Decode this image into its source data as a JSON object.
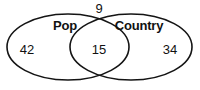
{
  "diagram": {
    "type": "venn-two-set",
    "stroke_color": "#141414",
    "fill_color": "none",
    "background_color": "#ffffff",
    "sets": [
      {
        "id": "left",
        "title": "Pop",
        "title_x": 65,
        "title_y": 25,
        "only_count": "42",
        "only_count_x": 27,
        "only_count_y": 49,
        "ellipse_cx": 68,
        "ellipse_cy": 47,
        "ellipse_rx": 61,
        "ellipse_ry": 33
      },
      {
        "id": "right",
        "title": "Country",
        "title_x": 139,
        "title_y": 25,
        "only_count": "34",
        "only_count_x": 170,
        "only_count_y": 49,
        "ellipse_cx": 131,
        "ellipse_cy": 47,
        "ellipse_rx": 61,
        "ellipse_ry": 33
      }
    ],
    "intersection": {
      "label": "15",
      "x": 99,
      "y": 49
    },
    "outside": {
      "label": "9",
      "x": 99,
      "y": 8
    }
  },
  "chart_data": {
    "type": "venn",
    "title": "",
    "categories": [
      "Pop",
      "Country"
    ],
    "regions": [
      {
        "name": "Pop only",
        "value": 42
      },
      {
        "name": "Pop and Country",
        "value": 15
      },
      {
        "name": "Country only",
        "value": 34
      },
      {
        "name": "Neither",
        "value": 9
      }
    ],
    "set_totals": [
      {
        "name": "Pop",
        "value": 57
      },
      {
        "name": "Country",
        "value": 49
      }
    ],
    "total": 100,
    "legend": "none",
    "grid": false
  }
}
